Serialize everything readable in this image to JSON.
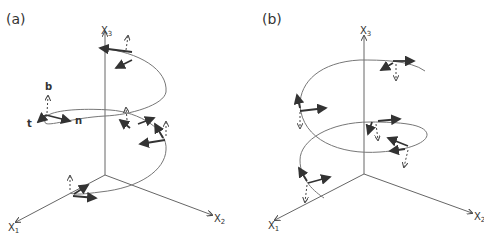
{
  "panels": [
    {
      "label": "(a)",
      "axes": {
        "x1": "X",
        "x1_sub": "1",
        "x2": "X",
        "x2_sub": "2",
        "x3": "X",
        "x3_sub": "3"
      },
      "frame_labels": {
        "tangent": "t",
        "normal": "n",
        "binormal": "b"
      }
    },
    {
      "label": "(b)",
      "axes": {
        "x1": "X",
        "x1_sub": "1",
        "x2": "X",
        "x2_sub": "2",
        "x3": "X",
        "x3_sub": "3"
      }
    }
  ],
  "colors": {
    "axis": "#666666",
    "curve": "#777777",
    "vector": "#333333"
  }
}
